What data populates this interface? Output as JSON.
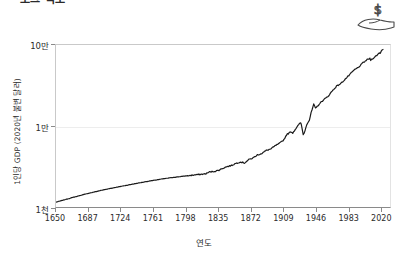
{
  "title": "로그 척도",
  "icon": {
    "name": "hand-holding-dollar-icon",
    "symbol": "$"
  },
  "axis": {
    "x_title": "연도",
    "y_title": "1인당 GDP (2020년 불변 달러)"
  },
  "chart_data": {
    "type": "line",
    "title": "로그 척도",
    "xlabel": "연도",
    "ylabel": "1인당 GDP (2020년 불변 달러)",
    "yscale": "log",
    "grid": true,
    "legend": "none",
    "line_color": "#1a1a1a",
    "xlim": [
      1650,
      2031
    ],
    "ylim": [
      1000,
      100000
    ],
    "xticks": [
      1650,
      1687,
      1724,
      1761,
      1798,
      1835,
      1872,
      1909,
      1946,
      1983,
      2020
    ],
    "xtick_labels": [
      "1650",
      "1687",
      "1724",
      "1761",
      "1798",
      "1835",
      "1872",
      "1909",
      "1946",
      "1983",
      "2020"
    ],
    "yticks": [
      1000,
      10000,
      100000
    ],
    "ytick_labels": [
      "1천",
      "1만",
      "10만"
    ],
    "series": [
      {
        "name": "1인당 GDP",
        "x": [
          1650,
          1660,
          1670,
          1680,
          1690,
          1700,
          1710,
          1720,
          1730,
          1740,
          1750,
          1760,
          1770,
          1780,
          1790,
          1800,
          1810,
          1815,
          1820,
          1825,
          1830,
          1835,
          1840,
          1845,
          1850,
          1855,
          1860,
          1865,
          1870,
          1875,
          1880,
          1885,
          1890,
          1895,
          1900,
          1905,
          1910,
          1913,
          1918,
          1920,
          1925,
          1929,
          1930,
          1932,
          1933,
          1936,
          1939,
          1941,
          1944,
          1946,
          1950,
          1955,
          1960,
          1965,
          1970,
          1975,
          1980,
          1985,
          1990,
          1995,
          2000,
          2005,
          2008,
          2009,
          2012,
          2015,
          2019,
          2020,
          2021,
          2023
        ],
        "y": [
          1150,
          1230,
          1320,
          1410,
          1500,
          1590,
          1680,
          1760,
          1850,
          1940,
          2030,
          2120,
          2210,
          2290,
          2360,
          2430,
          2500,
          2530,
          2560,
          2700,
          2750,
          2820,
          3000,
          3150,
          3250,
          3450,
          3600,
          3500,
          3850,
          4050,
          4400,
          4600,
          5000,
          5200,
          5700,
          6100,
          6800,
          7800,
          8500,
          8200,
          9800,
          11000,
          10200,
          7900,
          8100,
          10500,
          11800,
          14500,
          18500,
          16500,
          18500,
          21000,
          23000,
          27000,
          31000,
          33500,
          38000,
          43000,
          49000,
          53000,
          60000,
          66000,
          68000,
          65000,
          69000,
          73000,
          80000,
          79000,
          85000,
          88000
        ]
      }
    ]
  }
}
